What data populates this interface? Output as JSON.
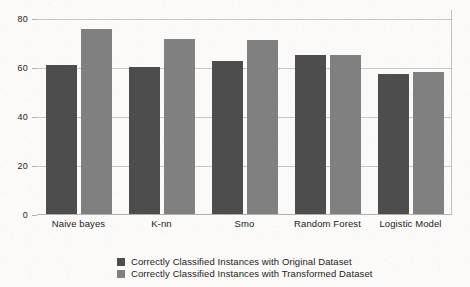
{
  "chart_data": {
    "type": "bar",
    "title": "",
    "subtitle": "",
    "xlabel": "",
    "ylabel": "",
    "categories": [
      "Naive bayes",
      "K-nn",
      "Smo",
      "Random Forest",
      "Logistic Model"
    ],
    "series": [
      {
        "name": "Correctly Classified Instances with Original Dataset",
        "color": "#4d4d4d",
        "values": [
          61,
          60,
          62.5,
          65,
          57
        ]
      },
      {
        "name": "Correctly Classified Instances with Transformed Dataset",
        "color": "#808080",
        "values": [
          75.5,
          71.5,
          71,
          65,
          58
        ]
      }
    ],
    "ylim": [
      0,
      80
    ],
    "yticks": [
      0,
      20,
      40,
      60,
      80
    ],
    "ytick_labels": [
      "0",
      "20",
      "40",
      "60",
      "80"
    ],
    "grid": true,
    "grid_axis": "y",
    "legend_position": "bottom-center",
    "background_color": "#fbfaf8",
    "grid_color": "#c9c7c4",
    "axis_color": "#b3b1ae",
    "text_color": "#1b1b1b"
  },
  "legend": {
    "entries": [
      {
        "label": "Correctly Classified Instances with Original Dataset",
        "color": "#4d4d4d"
      },
      {
        "label": "Correctly Classified Instances with Transformed Dataset",
        "color": "#808080"
      }
    ]
  }
}
